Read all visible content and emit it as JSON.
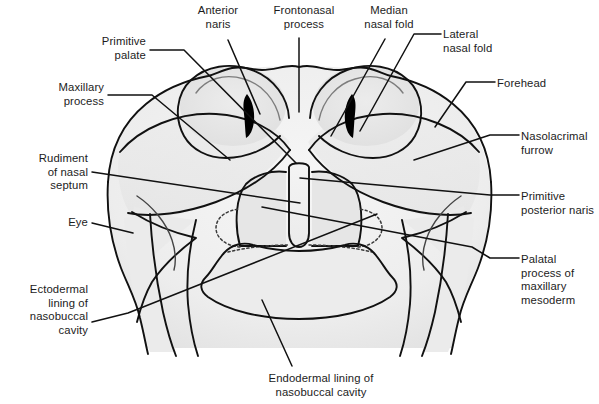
{
  "figure": {
    "domain_note": "anatomical line diagram",
    "colors": {
      "background": "#ffffff",
      "ink": "#1c1c1c",
      "outline": "#111111",
      "leader_line": "#111111",
      "fill_light": "#f2f2f2",
      "fill_mid": "#e8e8e8",
      "fill_dark": "#dedede",
      "naris_black": "#000000",
      "dotted_line": "#3a3a3a"
    },
    "labels": [
      {
        "id": "anterior-naris",
        "text": "Anterior\nnaris",
        "align": "center",
        "x": 176,
        "y": 4,
        "w": 84
      },
      {
        "id": "frontonasal-process",
        "text": "Frontonasal\nprocess",
        "align": "center",
        "x": 258,
        "y": 4,
        "w": 92
      },
      {
        "id": "median-nasal-fold",
        "text": "Median\nnasal fold",
        "align": "center",
        "x": 348,
        "y": 4,
        "w": 82
      },
      {
        "id": "lateral-nasal-fold",
        "text": "Lateral\nnasal fold",
        "align": "left",
        "x": 443,
        "y": 28,
        "w": 86
      },
      {
        "id": "primitive-palate",
        "text": "Primitive\npalate",
        "align": "right",
        "x": 58,
        "y": 35,
        "w": 88
      },
      {
        "id": "forehead",
        "text": "Forehead",
        "align": "left",
        "x": 497,
        "y": 77,
        "w": 80
      },
      {
        "id": "maxillary-process",
        "text": "Maxillary\nprocess",
        "align": "right",
        "x": 20,
        "y": 81,
        "w": 84
      },
      {
        "id": "nasolacrimal-furrow",
        "text": "Nasolacrimal\nfurrow",
        "align": "left",
        "x": 521,
        "y": 130,
        "w": 78
      },
      {
        "id": "rudiment-of-nasal-septum",
        "text": "Rudiment\nof nasal\nseptum",
        "align": "right",
        "x": 6,
        "y": 152,
        "w": 82
      },
      {
        "id": "primitive-posterior-naris",
        "text": "Primitive\nposterior naris",
        "align": "left",
        "x": 521,
        "y": 190,
        "w": 78
      },
      {
        "id": "eye",
        "text": "Eye",
        "align": "right",
        "x": 30,
        "y": 216,
        "w": 58
      },
      {
        "id": "palatal-process-of-maxillary-mesoderm",
        "text": "Palatal\nprocess of\nmaxillary\nmesoderm",
        "align": "left",
        "x": 521,
        "y": 253,
        "w": 78
      },
      {
        "id": "ectodermal-lining-of-nasobuccal-cavity",
        "text": "Ectodermal\nlining of\nnasobuccal\ncavity",
        "align": "right",
        "x": 2,
        "y": 283,
        "w": 86
      },
      {
        "id": "endodermal-lining-of-nasobuccal-cavity",
        "text": "Endodermal lining of\nnasobuccal cavity",
        "align": "center",
        "x": 236,
        "y": 372,
        "w": 170
      }
    ],
    "leader_lines": [
      {
        "id": "leader-anterior-naris",
        "points": "228,40 260,114"
      },
      {
        "id": "leader-frontonasal-process",
        "points": "299,38 299,112"
      },
      {
        "id": "leader-median-nasal-fold",
        "points": "385,39 331,136"
      },
      {
        "id": "leader-lateral-nasal-fold",
        "points": "441,34 414,47 360,131"
      },
      {
        "id": "leader-primitive-palate",
        "points": "150,50 184,50 296,163"
      },
      {
        "id": "leader-forehead",
        "points": "495,82 466,82 435,127"
      },
      {
        "id": "leader-maxillary-process",
        "points": "108,95 152,95 230,160"
      },
      {
        "id": "leader-nasolacrimal-furrow",
        "points": "519,135 490,135 414,160"
      },
      {
        "id": "leader-rudiment-septum",
        "points": "92,172 218,176 300,203"
      },
      {
        "id": "leader-primitive-post-naris",
        "points": "519,195 490,195 300,178"
      },
      {
        "id": "leader-eye",
        "points": "92,223 118,223 133,233"
      },
      {
        "id": "leader-palatal-process",
        "points": "519,258 490,258 472,247 262,207"
      },
      {
        "id": "leader-ectodermal-lining",
        "points": "92,322 118,322 128,313 377,214"
      },
      {
        "id": "leader-endodermal-lining",
        "points": "292,366 262,300"
      }
    ]
  }
}
